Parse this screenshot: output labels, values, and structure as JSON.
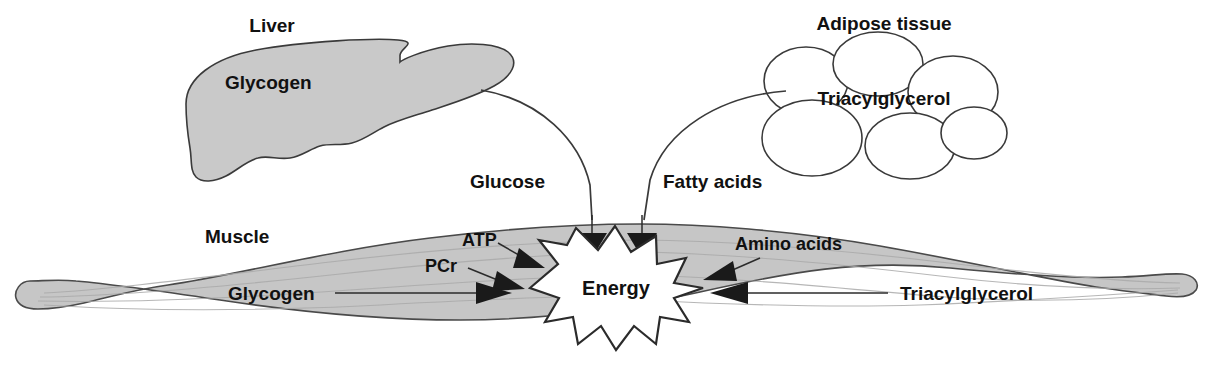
{
  "diagram": {
    "organs": {
      "liver": {
        "name_label": "Liver",
        "store_label": "Glycogen"
      },
      "adipose": {
        "name_label": "Adipose tissue",
        "store_label": "Triacylglycerol"
      },
      "muscle": {
        "name_label": "Muscle",
        "center_label": "Energy"
      }
    },
    "bloodborne_substrates": [
      {
        "label": "Glucose",
        "source": "liver"
      },
      {
        "label": "Fatty acids",
        "source": "adipose"
      }
    ],
    "intramuscular_substrates": [
      {
        "label": "ATP"
      },
      {
        "label": "PCr"
      },
      {
        "label": "Glycogen"
      }
    ],
    "incoming_substrates_right": [
      {
        "label": "Amino acids"
      },
      {
        "label": "Triacylglycerol"
      }
    ],
    "colors": {
      "organ_fill": "#c9c9c9",
      "muscle_fill": "#c6c6c6",
      "outline": "#3a3a3a",
      "text": "#111111",
      "arrowhead": "#1a1a1a",
      "star_fill": "#ffffff",
      "background": "#ffffff"
    }
  }
}
